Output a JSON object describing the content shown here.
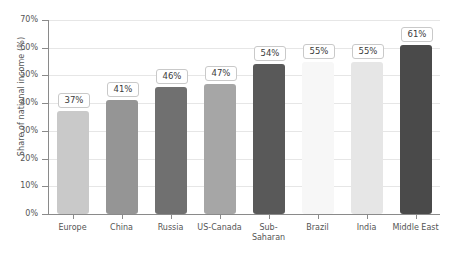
{
  "chart_data": {
    "type": "bar",
    "title": "",
    "xlabel": "",
    "ylabel": "Share of national income (%)",
    "ylim": [
      0,
      70
    ],
    "grid": true,
    "legend": "none",
    "categories": [
      "Europe",
      "China",
      "Russia",
      "US-Canada",
      "Sub-\nSaharan",
      "Brazil",
      "India",
      "Middle East"
    ],
    "values": [
      37,
      41,
      46,
      47,
      54,
      55,
      55,
      61
    ],
    "data_labels": [
      "37%",
      "41%",
      "46%",
      "47%",
      "54%",
      "55%",
      "55%",
      "61%"
    ],
    "bar_colors": [
      "#c9c9c9",
      "#959595",
      "#707070",
      "#a6a6a6",
      "#595959",
      "#f7f7f7",
      "#e6e6e6",
      "#4a4a4a"
    ],
    "y_ticks": [
      0,
      10,
      20,
      30,
      40,
      50,
      60,
      70
    ],
    "y_tick_labels": [
      "0%",
      "10%",
      "20%",
      "30%",
      "40%",
      "50%",
      "60%",
      "70%"
    ],
    "axis_color": "#8a8a8a",
    "grid_color": "#e6e6e6",
    "text_color": "#555555",
    "label_border_color": "#c9c9c9",
    "background_color": "#ffffff"
  }
}
